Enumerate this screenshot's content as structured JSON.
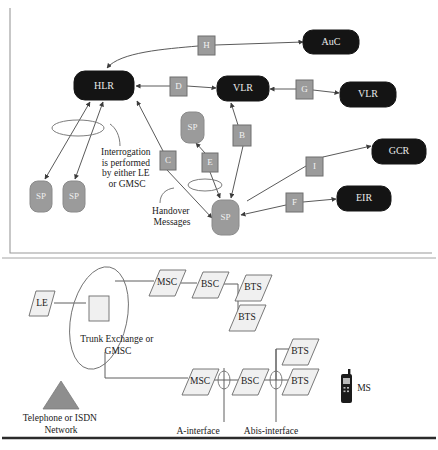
{
  "figure": {
    "panels": [
      "signalling-interfaces-panel",
      "network-topology-panel"
    ]
  },
  "colors": {
    "node_dark": "#141414",
    "node_gray": "#9b9b9b",
    "label_box": "#9b9b9b",
    "connector": "#5a5a5a",
    "triangle": "#8e8e8e",
    "rule_dark": "#2b2b2b"
  },
  "top_panel": {
    "dark_nodes": [
      {
        "id": "hlr",
        "label": "HLR",
        "x": 74,
        "y": 71,
        "w": 60,
        "h": 29
      },
      {
        "id": "auc",
        "label": "AuC",
        "x": 303,
        "y": 30,
        "w": 56,
        "h": 24
      },
      {
        "id": "vlr",
        "label": "VLR",
        "x": 217,
        "y": 76,
        "w": 52,
        "h": 25
      },
      {
        "id": "vlr2",
        "label": "VLR",
        "x": 340,
        "y": 82,
        "w": 56,
        "h": 25
      },
      {
        "id": "gcr",
        "label": "GCR",
        "x": 372,
        "y": 139,
        "w": 54,
        "h": 25
      },
      {
        "id": "eir",
        "label": "EIR",
        "x": 337,
        "y": 186,
        "w": 54,
        "h": 25
      }
    ],
    "gray_nodes": [
      {
        "id": "sp-left-1",
        "label": "SP",
        "x": 30,
        "y": 181,
        "w": 22,
        "h": 31
      },
      {
        "id": "sp-left-2",
        "label": "SP",
        "x": 63,
        "y": 181,
        "w": 22,
        "h": 31
      },
      {
        "id": "sp-upper",
        "label": "SP",
        "x": 181,
        "y": 112,
        "w": 23,
        "h": 31
      },
      {
        "id": "sp-center",
        "label": "SP",
        "x": 212,
        "y": 200,
        "w": 27,
        "h": 35
      }
    ],
    "interface_labels": [
      {
        "id": "H",
        "label": "H",
        "x": 198,
        "y": 36,
        "w": 17,
        "h": 19
      },
      {
        "id": "D",
        "label": "D",
        "x": 170,
        "y": 77,
        "w": 17,
        "h": 19
      },
      {
        "id": "G",
        "label": "G",
        "x": 296,
        "y": 80,
        "w": 17,
        "h": 19
      },
      {
        "id": "B",
        "label": "B",
        "x": 233,
        "y": 125,
        "w": 18,
        "h": 21
      },
      {
        "id": "C",
        "label": "C",
        "x": 160,
        "y": 151,
        "w": 16,
        "h": 19
      },
      {
        "id": "E",
        "label": "E",
        "x": 202,
        "y": 153,
        "w": 16,
        "h": 19
      },
      {
        "id": "I",
        "label": "I",
        "x": 306,
        "y": 157,
        "w": 17,
        "h": 19
      },
      {
        "id": "F",
        "label": "F",
        "x": 286,
        "y": 193,
        "w": 17,
        "h": 19
      }
    ],
    "notes": [
      {
        "id": "interrogation-note",
        "lines": [
          "Interrogation",
          "is performed",
          "by either LE",
          "or GMSC"
        ],
        "x": 127,
        "y": 152
      },
      {
        "id": "handover-note",
        "lines": [
          "Handover",
          "Messages"
        ],
        "x": 172,
        "y": 211
      }
    ]
  },
  "bottom_panel": {
    "parallelograms": [
      {
        "id": "le",
        "label": "LE",
        "cx": 42,
        "cy": 303
      },
      {
        "id": "msc-top",
        "label": "MSC",
        "cx": 167,
        "cy": 283
      },
      {
        "id": "bsc-top",
        "label": "BSC",
        "cx": 210,
        "cy": 285
      },
      {
        "id": "bts-top1",
        "label": "BTS",
        "cx": 253,
        "cy": 288
      },
      {
        "id": "bts-top2",
        "label": "BTS",
        "cx": 247,
        "cy": 318
      },
      {
        "id": "msc-bot",
        "label": "MSC",
        "cx": 200,
        "cy": 382
      },
      {
        "id": "bsc-bot",
        "label": "BSC",
        "cx": 250,
        "cy": 382
      },
      {
        "id": "bts-bot1",
        "label": "BTS",
        "cx": 300,
        "cy": 382
      },
      {
        "id": "bts-bot2",
        "label": "BTS",
        "cx": 300,
        "cy": 352
      }
    ],
    "trunk_exchange": {
      "id": "trunk-exchange",
      "lines": [
        "Trunk Exchange or",
        "GMSC"
      ],
      "label_x": 118,
      "label_y": 337
    },
    "network_triangle": {
      "id": "telephone-isdn-network",
      "lines": [
        "Telephone or ISDN",
        "Network"
      ],
      "label_x": 61,
      "label_y": 417
    },
    "mobile_station": {
      "id": "ms",
      "label": "MS",
      "x": 357,
      "y": 388
    },
    "interface_notes": [
      {
        "id": "a-interface",
        "label": "A-interface",
        "x": 198,
        "y": 432
      },
      {
        "id": "abis-interface",
        "label": "Abis-interface",
        "x": 269,
        "y": 432
      }
    ]
  }
}
